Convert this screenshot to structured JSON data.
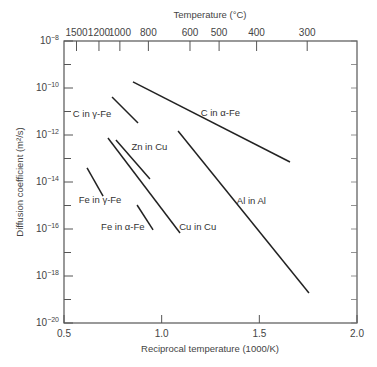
{
  "chart_data": {
    "type": "line",
    "title": "",
    "xlabel": "Reciprocal temperature (1000/K)",
    "ylabel": "Diffusion coefficient (m²/s)",
    "top_xlabel": "Temperature (°C)",
    "xlim": [
      0.5,
      2.0
    ],
    "ylim_log10": [
      -20,
      -8
    ],
    "yscale": "log",
    "grid": false,
    "x_ticks": [
      0.5,
      1.0,
      1.5,
      2.0
    ],
    "x_tick_labels": [
      "0.5",
      "1.0",
      "1.5",
      "2.0"
    ],
    "y_ticks_log10": [
      -8,
      -10,
      -12,
      -14,
      -16,
      -18,
      -20
    ],
    "y_tick_labels": [
      "10-8",
      "10-10",
      "10-12",
      "10-14",
      "10-16",
      "10-18",
      "10-20"
    ],
    "y_minor_ticks_log10": [
      -9,
      -11,
      -13,
      -15,
      -17,
      -19
    ],
    "top_ticks": [
      {
        "label": "1500",
        "x": 0.564
      },
      {
        "label": "1200",
        "x": 0.679
      },
      {
        "label": "1000",
        "x": 0.786
      },
      {
        "label": "800",
        "x": 0.932
      },
      {
        "label": "600",
        "x": 1.145
      },
      {
        "label": "500",
        "x": 1.294
      },
      {
        "label": "400",
        "x": 1.486
      },
      {
        "label": "300",
        "x": 1.745
      }
    ],
    "series": [
      {
        "name": "C in α-Fe",
        "x": [
          0.853,
          1.657
        ],
        "log10_D": [
          -9.74,
          -13.15
        ],
        "label_pos": [
          1.2,
          -11.2
        ]
      },
      {
        "name": "C in γ-Fe",
        "x": [
          0.746,
          0.879
        ],
        "log10_D": [
          -10.38,
          -11.49
        ],
        "label_pos": [
          0.545,
          -11.25
        ]
      },
      {
        "name": "Zn in Cu",
        "x": [
          0.766,
          0.94
        ],
        "log10_D": [
          -12.21,
          -13.87
        ],
        "label_pos": [
          0.845,
          -12.65
        ]
      },
      {
        "name": "Cu in Cu",
        "x": [
          0.725,
          1.094
        ],
        "log10_D": [
          -12.13,
          -16.17
        ],
        "label_pos": [
          1.09,
          -16.05
        ]
      },
      {
        "name": "Al in Al",
        "x": [
          1.084,
          1.754
        ],
        "log10_D": [
          -11.83,
          -18.72
        ],
        "label_pos": [
          1.385,
          -14.95
        ]
      },
      {
        "name": "Fe in γ-Fe",
        "x": [
          0.618,
          0.7
        ],
        "log10_D": [
          -13.4,
          -14.6
        ],
        "label_pos": [
          0.575,
          -14.9
        ]
      },
      {
        "name": "Fe in α-Fe",
        "x": [
          0.874,
          0.956
        ],
        "log10_D": [
          -14.98,
          -16.04
        ],
        "label_pos": [
          0.69,
          -16.05
        ]
      }
    ]
  }
}
